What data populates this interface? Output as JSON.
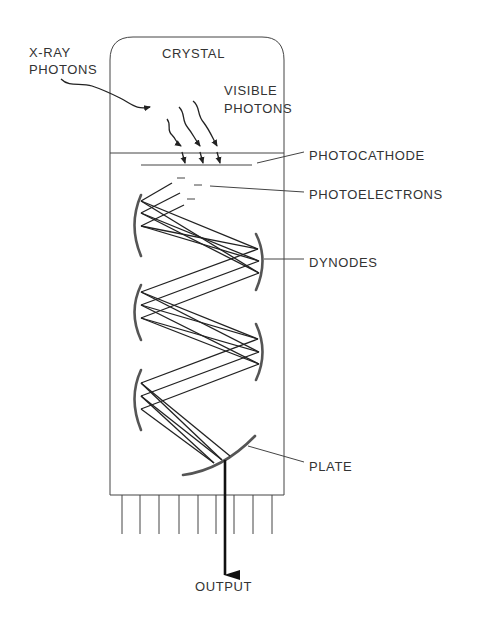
{
  "diagram": {
    "labels": {
      "xray_line1": "X-RAY",
      "xray_line2": "PHOTONS",
      "crystal": "CRYSTAL",
      "visible_line1": "VISIBLE",
      "visible_line2": "PHOTONS",
      "photocathode": "PHOTOCATHODE",
      "photoelectrons": "PHOTOELECTRONS",
      "dynodes": "DYNODES",
      "plate": "PLATE",
      "output": "OUTPUT"
    },
    "components": [
      {
        "id": "crystal",
        "label": "CRYSTAL"
      },
      {
        "id": "photocathode",
        "label": "PHOTOCATHODE"
      },
      {
        "id": "photoelectrons",
        "label": "PHOTOELECTRONS"
      },
      {
        "id": "dynodes",
        "label": "DYNODES",
        "count": 6
      },
      {
        "id": "plate",
        "label": "PLATE"
      },
      {
        "id": "output",
        "label": "OUTPUT"
      }
    ],
    "pins": 9,
    "colors": {
      "line": "#444444",
      "text": "#333333",
      "background": "#ffffff"
    }
  }
}
